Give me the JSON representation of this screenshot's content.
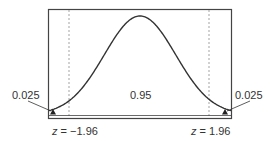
{
  "chart_data": {
    "type": "area",
    "title": "",
    "xlabel": "",
    "ylabel": "",
    "grid": false,
    "legend": null,
    "critical_values": [
      -1.96,
      1.96
    ],
    "regions": [
      {
        "name": "left tail",
        "area": 0.025,
        "range": [
          "-inf",
          -1.96
        ]
      },
      {
        "name": "center",
        "area": 0.95,
        "range": [
          -1.96,
          1.96
        ]
      },
      {
        "name": "right tail",
        "area": 0.025,
        "range": [
          1.96,
          "inf"
        ]
      }
    ],
    "annotations": [
      "0.025",
      "0.95",
      "0.025",
      "z = −1.96",
      "z = 1.96"
    ]
  },
  "labels": {
    "left_tail": "0.025",
    "center": "0.95",
    "right_tail": "0.025",
    "left_z_var": "z",
    "left_z_val": " = −1.96",
    "right_z_var": "z",
    "right_z_val": " = 1.96"
  },
  "colors": {
    "curve": "#333333",
    "frame": "#444444",
    "dashed": "#999999"
  }
}
